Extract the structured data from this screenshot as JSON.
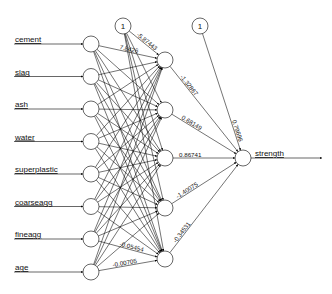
{
  "diagram": {
    "type": "neural-network",
    "inputs": [
      {
        "label": "cement",
        "x": 91,
        "y": 44
      },
      {
        "label": "slag",
        "x": 91,
        "y": 76.5
      },
      {
        "label": "ash",
        "x": 91,
        "y": 109
      },
      {
        "label": "water",
        "x": 91,
        "y": 141.5
      },
      {
        "label": "superplastic",
        "x": 91,
        "y": 174
      },
      {
        "label": "coarseagg",
        "x": 91,
        "y": 206.5
      },
      {
        "label": "fineagg",
        "x": 91,
        "y": 239
      },
      {
        "label": "age",
        "x": 91,
        "y": 272
      }
    ],
    "hidden": [
      {
        "x": 165,
        "y": 60
      },
      {
        "x": 165,
        "y": 110
      },
      {
        "x": 165,
        "y": 158
      },
      {
        "x": 165,
        "y": 208
      },
      {
        "x": 165,
        "y": 259
      }
    ],
    "bias_nodes": [
      {
        "label": "1",
        "x": 123,
        "y": 26
      },
      {
        "label": "1",
        "x": 200,
        "y": 26
      }
    ],
    "output": {
      "label": "strength",
      "x": 243,
      "y": 158
    },
    "visible_weights": {
      "cement_to_h1": "7.8426",
      "bias1_to_h1": "-5.87443",
      "h1_to_out": "-1.32867",
      "h2_to_out": "0.68149",
      "h3_to_out": "0.86741",
      "h4_to_out": "-1.40075",
      "h5_to_out": "-0.34531",
      "bias2_to_out": "0.79696",
      "age_to_h5": "-0.00705",
      "fineagg_to_h5": "-0.05454"
    }
  }
}
